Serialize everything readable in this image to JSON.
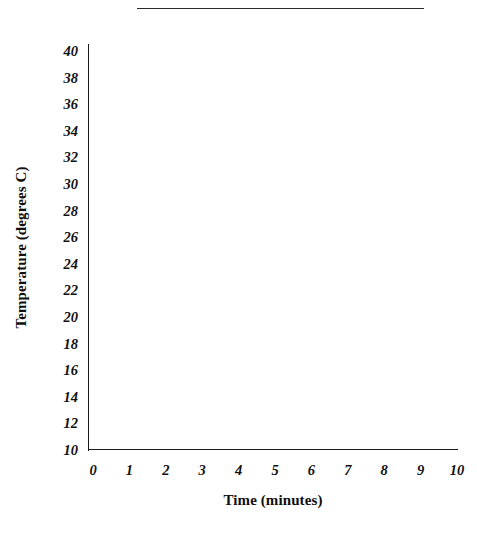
{
  "figure": {
    "divider_present": true,
    "background_color": "#ffffff",
    "axis_color": "#1a1a1a"
  },
  "chart_data": {
    "type": "line",
    "title": "",
    "subtitle": "",
    "xlabel": "Time (minutes)",
    "ylabel": "Temperature (degrees C)",
    "x": [
      0,
      1,
      2,
      3,
      4,
      5,
      6,
      7,
      8,
      9,
      10
    ],
    "xtick_labels": [
      "0",
      "1",
      "2",
      "3",
      "4",
      "5",
      "6",
      "7",
      "8",
      "9",
      "10"
    ],
    "xlim": [
      0,
      10
    ],
    "ytick_values": [
      40,
      38,
      36,
      34,
      32,
      30,
      28,
      26,
      24,
      22,
      20,
      18,
      16,
      14,
      12,
      10
    ],
    "ytick_labels": [
      "40",
      "38",
      "36",
      "34",
      "32",
      "30",
      "28",
      "26",
      "24",
      "22",
      "20",
      "18",
      "16",
      "14",
      "12",
      "10"
    ],
    "ylim": [
      10,
      40
    ],
    "grid": false,
    "legend": null,
    "series": [],
    "annotations": []
  }
}
